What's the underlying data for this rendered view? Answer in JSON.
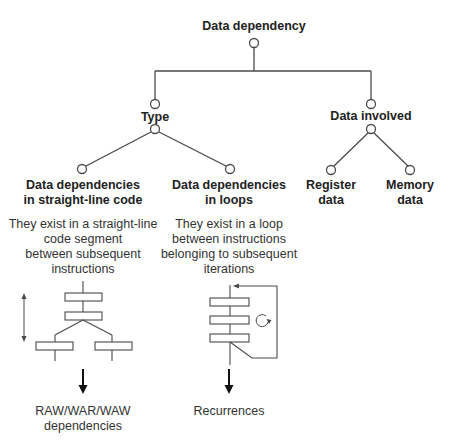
{
  "diagram": {
    "root": {
      "label": "Data dependency"
    },
    "branches": [
      {
        "label": "Type",
        "children": [
          {
            "title_line1": "Data dependencies",
            "title_line2": "in straight-line code",
            "desc_lines": [
              "They exist in a straight-line",
              "code segment",
              "between subsequent",
              "instructions"
            ],
            "illustration": "branching-code-segment",
            "result_lines": [
              "RAW/WAR/WAW",
              "dependencies"
            ]
          },
          {
            "title_line1": "Data dependencies",
            "title_line2": "in loops",
            "desc_lines": [
              "They exist in a loop",
              "between instructions",
              "belonging to subsequent",
              "iterations"
            ],
            "illustration": "loop-iterations",
            "result_lines": [
              "Recurrences"
            ]
          }
        ]
      },
      {
        "label": "Data involved",
        "children": [
          {
            "line1": "Register",
            "line2": "data"
          },
          {
            "line1": "Memory",
            "line2": "data"
          }
        ]
      }
    ],
    "colors": {
      "line": "#4a4a4a",
      "text": "#222222",
      "background": "#ffffff"
    }
  }
}
